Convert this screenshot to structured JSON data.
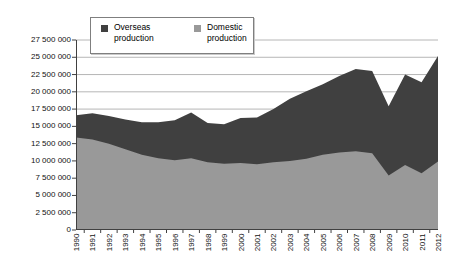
{
  "colors": {
    "overseas": "#404040",
    "domestic": "#999999",
    "gridline": "#a3a3a3",
    "axis": "#404040",
    "background": "#ffffff",
    "legend_border": "#7f7f7f"
  },
  "legend": {
    "position": "top-inside-left"
  },
  "chart_data": {
    "type": "area",
    "stacked": true,
    "title": "",
    "xlabel": "",
    "ylabel": "",
    "grid": true,
    "ylim": [
      0,
      27500000
    ],
    "ytick_step": 2500000,
    "ytick_labels": [
      "0",
      "2 500 000",
      "5 000 000",
      "7 500 000",
      "10 000 000",
      "12 500 000",
      "15 000 000",
      "17 500 000",
      "20 000 000",
      "22 500 000",
      "25 000 000",
      "27 500 000"
    ],
    "categories": [
      "1990",
      "1991",
      "1992",
      "1993",
      "1994",
      "1995",
      "1996",
      "1997",
      "1998",
      "1999",
      "2000",
      "2001",
      "2002",
      "2003",
      "2004",
      "2005",
      "2006",
      "2007",
      "2008",
      "2009",
      "2010",
      "2011",
      "2012"
    ],
    "series": [
      {
        "name": "Overseas production",
        "color": "#404040",
        "values": [
          3200000,
          3800000,
          4000000,
          4300000,
          4700000,
          5200000,
          5800000,
          6600000,
          5700000,
          5700000,
          6500000,
          6800000,
          7700000,
          9000000,
          9800000,
          10200000,
          11100000,
          11900000,
          11900000,
          10000000,
          13100000,
          13200000,
          15300000
        ]
      },
      {
        "name": "Domestic production",
        "color": "#999999",
        "values": [
          13400000,
          13100000,
          12500000,
          11700000,
          10900000,
          10400000,
          10100000,
          10400000,
          9800000,
          9600000,
          9700000,
          9500000,
          9800000,
          10000000,
          10300000,
          10900000,
          11200000,
          11400000,
          11100000,
          7900000,
          9400000,
          8200000,
          9900000
        ]
      }
    ]
  }
}
